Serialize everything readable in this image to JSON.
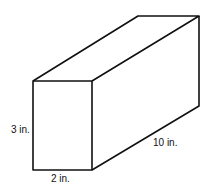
{
  "diagram": {
    "type": "rectangular-prism",
    "labels": {
      "height": "3 in.",
      "width": "2 in.",
      "length": "10 in."
    }
  }
}
